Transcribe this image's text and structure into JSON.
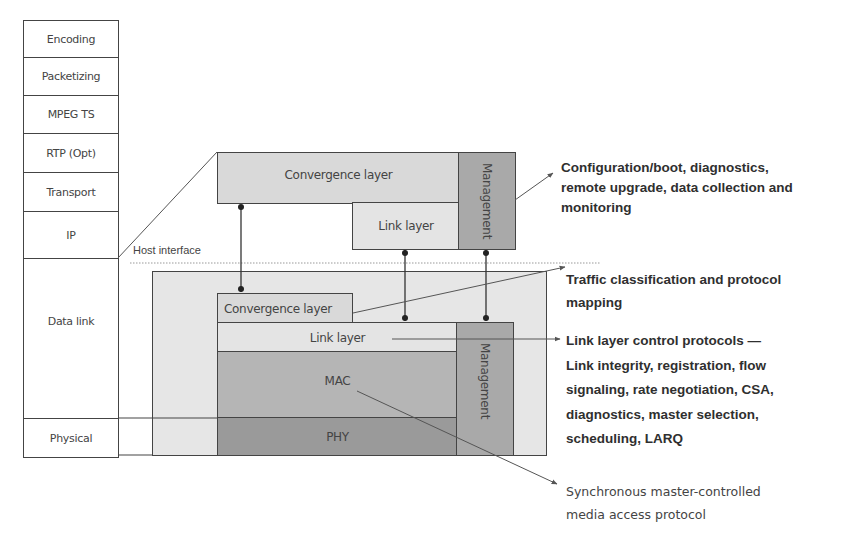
{
  "protocol_stack": {
    "layers": [
      {
        "label": "Encoding"
      },
      {
        "label": "Packetizing"
      },
      {
        "label": "MPEG TS"
      },
      {
        "label": "RTP (Opt)"
      },
      {
        "label": "Transport"
      },
      {
        "label": "IP"
      },
      {
        "label": "Data link"
      },
      {
        "label": "Physical"
      }
    ]
  },
  "host_block": {
    "convergence_layer": "Convergence layer",
    "link_layer": "Link layer",
    "management": "Management"
  },
  "host_interface_label": "Host interface",
  "device_block": {
    "convergence_layer": "Convergence layer",
    "link_layer": "Link layer",
    "mac": "MAC",
    "phy": "PHY",
    "management": "Management"
  },
  "annotations": {
    "management": {
      "lines": [
        "Configuration/boot, diagnostics,",
        "remote upgrade, data collection and",
        "monitoring"
      ]
    },
    "convergence": {
      "lines": [
        "Traffic classification and protocol",
        "mapping"
      ]
    },
    "link_layer": {
      "lines": [
        "Link layer control protocols —",
        "Link integrity, registration, flow",
        "signaling, rate negotiation, CSA,",
        "diagnostics, master selection,",
        "scheduling, LARQ"
      ]
    },
    "mac": {
      "lines": [
        "Synchronous master-controlled",
        "media access protocol"
      ]
    }
  },
  "colors": {
    "line": "#444444",
    "light_fill": "#d9d9d9",
    "outer_fill": "#e6e6e6",
    "mac_fill": "#b5b5b5",
    "phy_fill": "#9a9a9a",
    "management_fill": "#a9a9a9"
  }
}
